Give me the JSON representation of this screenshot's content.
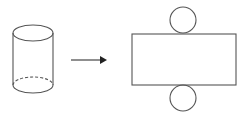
{
  "diagram": {
    "stroke_color": "#555555",
    "background": "#ffffff",
    "shapes": [
      {
        "id": "cylinder",
        "kind": "3d-cylinder",
        "label": "cylinder"
      },
      {
        "id": "arrow",
        "kind": "arrow",
        "direction": "right"
      },
      {
        "id": "net-rectangle",
        "kind": "rectangle",
        "label": "lateral surface"
      },
      {
        "id": "net-top-circle",
        "kind": "circle",
        "label": "top base"
      },
      {
        "id": "net-bottom-circle",
        "kind": "circle",
        "label": "bottom base"
      }
    ]
  }
}
